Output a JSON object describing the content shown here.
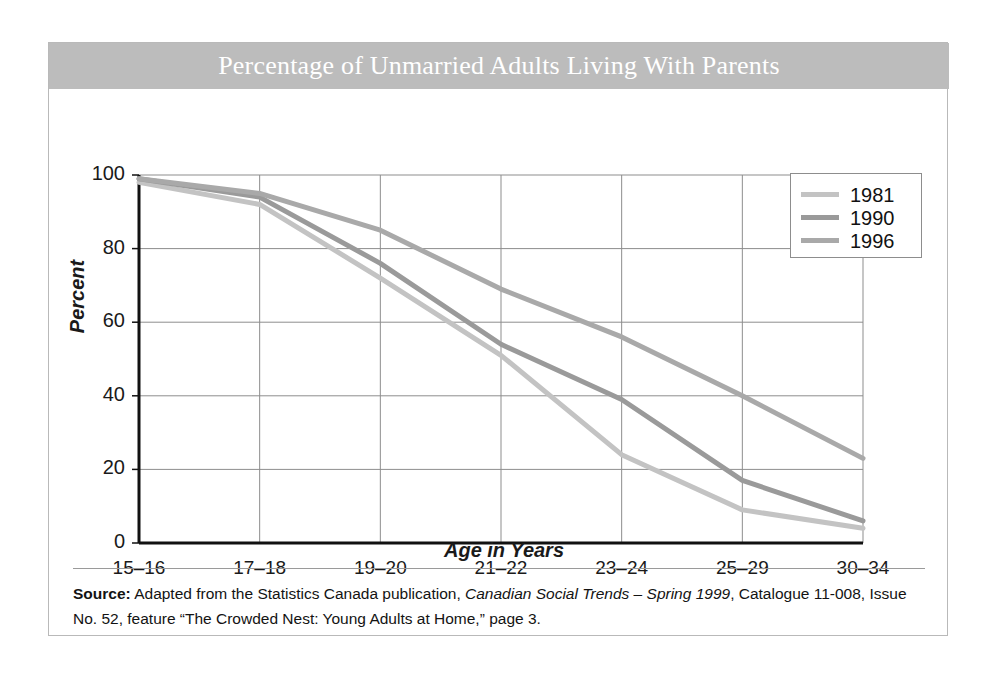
{
  "figure": {
    "title": "Percentage of Unmarried Adults Living With Parents",
    "title_band_color": "#bcbcbc",
    "frame_border_color": "#b9b9b9"
  },
  "source": {
    "label": "Source:",
    "text_part1": " Adapted from the Statistics Canada publication, ",
    "publication": "Canadian Social Trends – Spring 1999",
    "text_part2": ", Catalogue 11-008, Issue No. 52, feature “The Crowded Nest: Young Adults at Home,” page 3."
  },
  "chart_data": {
    "type": "line",
    "title": "Percentage of Unmarried Adults Living With Parents",
    "xlabel": "Age in Years",
    "ylabel": "Percent",
    "categories": [
      "15–16",
      "17–18",
      "19–20",
      "21–22",
      "23–24",
      "25–29",
      "30–34"
    ],
    "ylim": [
      0,
      100
    ],
    "yticks": [
      0,
      20,
      40,
      60,
      80,
      100
    ],
    "grid": true,
    "legend_position": "top-right",
    "series": [
      {
        "name": "1981",
        "color": "#c3c3c3",
        "values": [
          98,
          92,
          72,
          51,
          24,
          9,
          4
        ]
      },
      {
        "name": "1990",
        "color": "#9a9a9a",
        "values": [
          99,
          94,
          76,
          54,
          39,
          17,
          6
        ]
      },
      {
        "name": "1996",
        "color": "#a9a9a9",
        "values": [
          99,
          95,
          85,
          69,
          56,
          40,
          23
        ]
      }
    ]
  }
}
